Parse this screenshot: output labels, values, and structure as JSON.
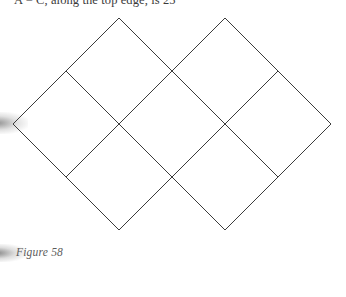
{
  "page": {
    "width": 346,
    "height": 297,
    "background_color": "#ffffff"
  },
  "body_text": {
    "clipped_line": "A = C, along the top edge, is 25"
  },
  "caption": {
    "text": "Figure 58"
  },
  "figure": {
    "name": "diamond-lattice",
    "stroke_color": "#3b3b3b",
    "stroke_width": 1,
    "fill": "none",
    "grid": {
      "origin_x": 13,
      "origin_y": 124,
      "half_diagonal": 53,
      "cells": [
        {
          "cx": 66,
          "cy": 124
        },
        {
          "cx": 119,
          "cy": 71
        },
        {
          "cx": 172,
          "cy": 124
        },
        {
          "cx": 225,
          "cy": 71
        },
        {
          "cx": 278,
          "cy": 124
        },
        {
          "cx": 119,
          "cy": 177
        },
        {
          "cx": 225,
          "cy": 177
        }
      ]
    },
    "vertices": [
      {
        "label": "left-corner",
        "x": 13,
        "y": 124
      },
      {
        "label": "top-apex-left",
        "x": 119,
        "y": 18
      },
      {
        "label": "top-apex-right",
        "x": 225,
        "y": 18
      },
      {
        "label": "right-corner",
        "x": 331,
        "y": 124
      },
      {
        "label": "bottom-apex",
        "x": 172,
        "y": 283
      }
    ]
  }
}
